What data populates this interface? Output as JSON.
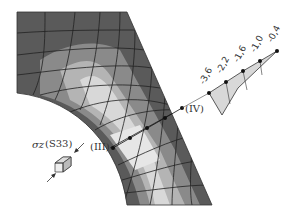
{
  "figure": {
    "section_labels": {
      "start": "(III)",
      "end": "(IV)"
    },
    "stress_component": {
      "symbol": "σz",
      "name": "(S33)"
    },
    "stress_profile_ticks": [
      "-3,6",
      "-2,2",
      "-1,6",
      "-1,0",
      "-0,4"
    ],
    "colors": {
      "dark": "#555555",
      "mid": "#8a8a8a",
      "light": "#c8c8c8",
      "lightest": "#dedede",
      "mesh": "#222222"
    }
  }
}
